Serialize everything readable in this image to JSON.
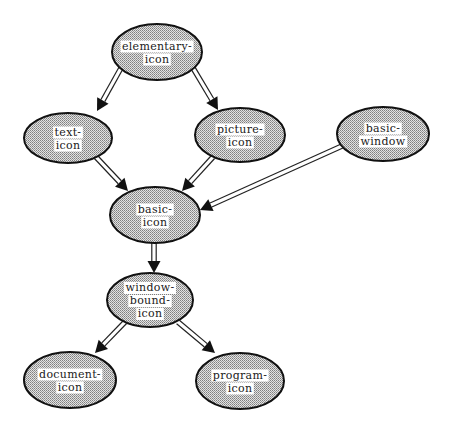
{
  "diagram": {
    "type": "inheritance-graph",
    "nodes": [
      {
        "id": "elementary-icon",
        "lines": [
          "elementary-",
          "icon"
        ],
        "cx": 157,
        "cy": 52,
        "rx": 45,
        "ry": 28
      },
      {
        "id": "text-icon",
        "lines": [
          "text-",
          "icon"
        ],
        "cx": 68,
        "cy": 138,
        "rx": 44,
        "ry": 25
      },
      {
        "id": "picture-icon",
        "lines": [
          "picture-",
          "icon"
        ],
        "cx": 240,
        "cy": 135,
        "rx": 45,
        "ry": 27
      },
      {
        "id": "basic-window",
        "lines": [
          "basic-",
          "window"
        ],
        "cx": 383,
        "cy": 134,
        "rx": 46,
        "ry": 27
      },
      {
        "id": "basic-icon",
        "lines": [
          "basic-",
          "icon"
        ],
        "cx": 155,
        "cy": 215,
        "rx": 45,
        "ry": 28
      },
      {
        "id": "window-bound-icon",
        "lines": [
          "window-",
          "bound-",
          "icon"
        ],
        "cx": 150,
        "cy": 300,
        "rx": 43,
        "ry": 27
      },
      {
        "id": "document-icon",
        "lines": [
          "document-",
          "icon"
        ],
        "cx": 70,
        "cy": 380,
        "rx": 46,
        "ry": 28
      },
      {
        "id": "program-icon",
        "lines": [
          "program-",
          "icon"
        ],
        "cx": 240,
        "cy": 381,
        "rx": 44,
        "ry": 28
      }
    ],
    "edges": [
      {
        "from": "elementary-icon",
        "to": "text-icon",
        "x1": 121,
        "y1": 68,
        "x2": 97,
        "y2": 111
      },
      {
        "from": "elementary-icon",
        "to": "picture-icon",
        "x1": 193,
        "y1": 68,
        "x2": 218,
        "y2": 110
      },
      {
        "from": "text-icon",
        "to": "basic-icon",
        "x1": 96,
        "y1": 157,
        "x2": 128,
        "y2": 191
      },
      {
        "from": "picture-icon",
        "to": "basic-icon",
        "x1": 213,
        "y1": 157,
        "x2": 182,
        "y2": 191
      },
      {
        "from": "basic-window",
        "to": "basic-icon",
        "x1": 342,
        "y1": 146,
        "x2": 200,
        "y2": 210
      },
      {
        "from": "basic-icon",
        "to": "window-bound-icon",
        "x1": 154,
        "y1": 243,
        "x2": 154,
        "y2": 273
      },
      {
        "from": "window-bound-icon",
        "to": "document-icon",
        "x1": 125,
        "y1": 322,
        "x2": 95,
        "y2": 353
      },
      {
        "from": "window-bound-icon",
        "to": "program-icon",
        "x1": 178,
        "y1": 322,
        "x2": 215,
        "y2": 353
      }
    ],
    "colors": {
      "stroke": "#111111",
      "fill_dot": "#8a8a8a",
      "fill_bg": "#e6e6e6",
      "background": "#ffffff"
    }
  }
}
